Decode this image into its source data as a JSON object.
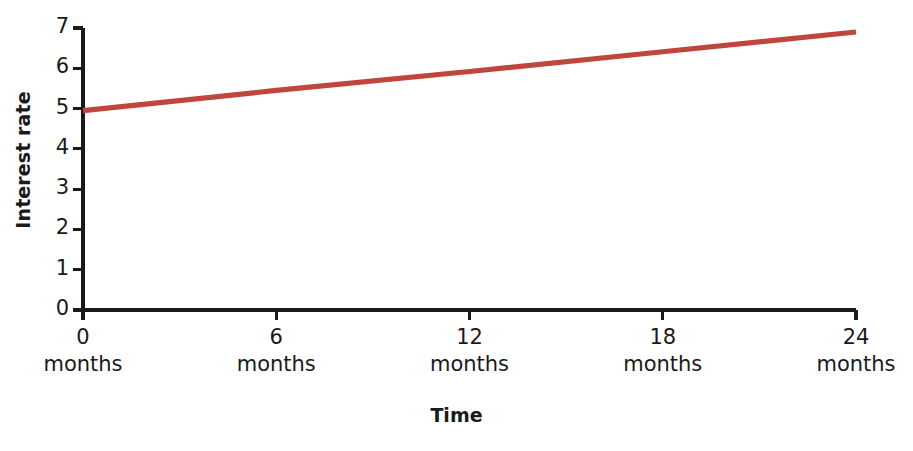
{
  "chart_data": {
    "type": "line",
    "title": "",
    "xlabel": "Time",
    "ylabel": "Interest rate",
    "grid": false,
    "legend": "none",
    "xlim": [
      0,
      24
    ],
    "ylim": [
      0,
      7
    ],
    "x_tick_values": [
      0,
      6,
      12,
      18,
      24
    ],
    "x_tick_labels": [
      "0",
      "6",
      "12",
      "18",
      "24"
    ],
    "x_tick_unit": "months",
    "y_tick_values": [
      0,
      1,
      2,
      3,
      4,
      5,
      6,
      7
    ],
    "y_tick_labels": [
      "0",
      "1",
      "2",
      "3",
      "4",
      "5",
      "6",
      "7"
    ],
    "series": [
      {
        "name": "Interest rate",
        "color": "#c0453c",
        "x": [
          0,
          6,
          12,
          18,
          24
        ],
        "values": [
          4.95,
          5.45,
          5.92,
          6.41,
          6.9
        ]
      }
    ]
  },
  "axes": {
    "y_title": "Interest rate",
    "x_title": "Time",
    "y_ticks": [
      {
        "label": "7"
      },
      {
        "label": "6"
      },
      {
        "label": "5"
      },
      {
        "label": "4"
      },
      {
        "label": "3"
      },
      {
        "label": "2"
      },
      {
        "label": "1"
      },
      {
        "label": "0"
      }
    ],
    "x_ticks": [
      {
        "num": "0",
        "unit": "months"
      },
      {
        "num": "6",
        "unit": "months"
      },
      {
        "num": "12",
        "unit": "months"
      },
      {
        "num": "18",
        "unit": "months"
      },
      {
        "num": "24",
        "unit": "months"
      }
    ]
  },
  "colors": {
    "line": "#c0453c",
    "axis": "#1a1a1a",
    "background": "#ffffff",
    "text": "#1a1a1a"
  }
}
